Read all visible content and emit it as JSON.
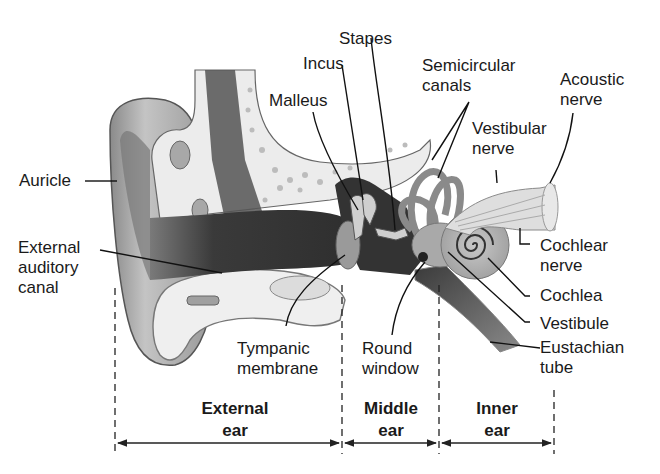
{
  "diagram": {
    "labels": {
      "stapes": "Stapes",
      "incus": "Incus",
      "malleus": "Malleus",
      "semicircular_canals": "Semicircular\ncanals",
      "acoustic_nerve": "Acoustic\nnerve",
      "vestibular_nerve": "Vestibular\nnerve",
      "auricle": "Auricle",
      "external_auditory_canal": "External\nauditory\ncanal",
      "cochlear_nerve": "Cochlear\nnerve",
      "cochlea": "Cochlea",
      "vestibule": "Vestibule",
      "eustachian_tube": "Eustachian\ntube",
      "tympanic_membrane": "Tympanic\nmembrane",
      "round_window": "Round\nwindow"
    },
    "regions": [
      {
        "label": "External\near"
      },
      {
        "label": "Middle\near"
      },
      {
        "label": "Inner\near"
      }
    ],
    "colors": {
      "skin": "#a8a8a8",
      "skin_dark": "#6e6e6e",
      "bone": "#ebebeb",
      "canal": "#3c3c3c",
      "text": "#1a1a1a"
    }
  }
}
